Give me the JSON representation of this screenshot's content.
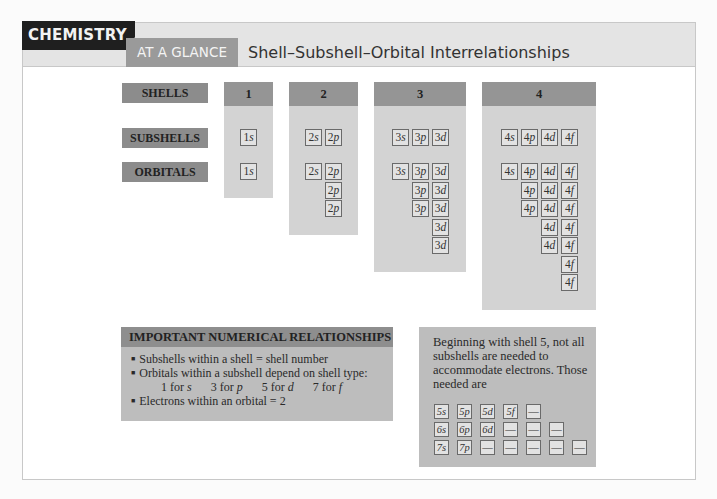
{
  "header": {
    "tag": "CHEMISTRY",
    "subtag": "AT A GLANCE",
    "title": "Shell–Subshell–Orbital Interrelationships"
  },
  "row_labels": {
    "shells": "SHELLS",
    "subshells": "SUBSHELLS",
    "orbitals": "ORBITALS"
  },
  "shells": [
    {
      "label": "1",
      "subshells": [
        "1s"
      ],
      "orbitals": [
        [
          "1s"
        ]
      ]
    },
    {
      "label": "2",
      "subshells": [
        "2s",
        "2p"
      ],
      "orbitals": [
        [
          "2s"
        ],
        [
          "2p",
          "2p",
          "2p"
        ]
      ]
    },
    {
      "label": "3",
      "subshells": [
        "3s",
        "3p",
        "3d"
      ],
      "orbitals": [
        [
          "3s"
        ],
        [
          "3p",
          "3p",
          "3p"
        ],
        [
          "3d",
          "3d",
          "3d",
          "3d",
          "3d"
        ]
      ]
    },
    {
      "label": "4",
      "subshells": [
        "4s",
        "4p",
        "4d",
        "4f"
      ],
      "orbitals": [
        [
          "4s"
        ],
        [
          "4p",
          "4p",
          "4p"
        ],
        [
          "4d",
          "4d",
          "4d",
          "4d",
          "4d"
        ],
        [
          "4f",
          "4f",
          "4f",
          "4f",
          "4f",
          "4f",
          "4f"
        ]
      ]
    }
  ],
  "important": {
    "heading": "IMPORTANT NUMERICAL RELATIONSHIPS",
    "items": [
      "Subshells within a shell = shell number",
      "Orbitals within a subshell depend on shell type:",
      "Electrons within an orbital = 2"
    ],
    "orbital_counts": [
      {
        "count": "1 for",
        "type": "s"
      },
      {
        "count": "3 for",
        "type": "p"
      },
      {
        "count": "5 for",
        "type": "d"
      },
      {
        "count": "7 for",
        "type": "f"
      }
    ]
  },
  "beyond": {
    "text": "Beginning with shell 5, not all subshells are needed to accommodate electrons. Those needed are",
    "rows": [
      [
        "5s",
        "5p",
        "5d",
        "5f",
        "—"
      ],
      [
        "6s",
        "6p",
        "6d",
        "—",
        "—",
        "—"
      ],
      [
        "7s",
        "7p",
        "—",
        "—",
        "—",
        "—",
        "—"
      ]
    ]
  }
}
